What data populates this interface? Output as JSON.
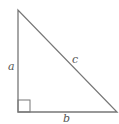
{
  "diagram": {
    "type": "right-triangle",
    "labels": {
      "a": "a",
      "b": "b",
      "c": "c"
    },
    "colors": {
      "stroke": "#777777",
      "label": "#555555",
      "background": "#ffffff"
    }
  }
}
